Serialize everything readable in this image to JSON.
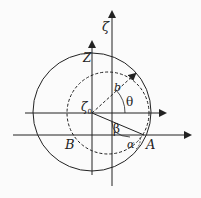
{
  "diagram": {
    "labels": {
      "zeta_axis": "ζ",
      "z_axis": "Z",
      "zeta0": "ζ",
      "zeta0_sub": "0",
      "b": "b",
      "theta": "θ",
      "beta": "β",
      "alpha": "α",
      "A": "A",
      "B": "B"
    },
    "colors": {
      "stroke": "#222222",
      "background": "#fbfbfb"
    },
    "geometry": {
      "big_circle": {
        "cx": 92,
        "cy": 112,
        "r": 59,
        "style": "solid"
      },
      "dashed_circle": {
        "cx": 108,
        "cy": 113,
        "r": 41,
        "style": "dashed"
      },
      "zeta0_point": [
        92,
        113
      ],
      "A_point": [
        144,
        135
      ]
    }
  }
}
